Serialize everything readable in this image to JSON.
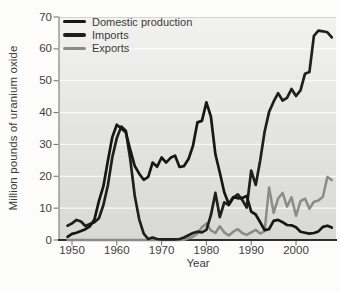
{
  "figure_title": "U.S. uranium oxide production, imports and exports",
  "colors": {
    "domestic_production": "#161616",
    "imports": "#1f1f1f",
    "exports": "#8b8b8b",
    "plot_background_top": "#f2f2f0",
    "plot_background_bottom": "#d8d8d6",
    "gridline": "#ffffff",
    "axis": "#2e2e2e",
    "tick_text": "#414141"
  },
  "chart_data": {
    "type": "line",
    "title": "",
    "xlabel": "Year",
    "ylabel": "Million pounds of uranium oxide",
    "xlim": [
      1947,
      2009
    ],
    "ylim": [
      0,
      70
    ],
    "x_ticks": [
      1950,
      1960,
      1970,
      1980,
      1990,
      2000
    ],
    "y_ticks": [
      0,
      10,
      20,
      30,
      40,
      50,
      60,
      70
    ],
    "grid": "horizontal white gridlines every 10 units",
    "legend_position": "top-left inside plot",
    "x": [
      1949,
      1950,
      1951,
      1952,
      1953,
      1954,
      1955,
      1956,
      1957,
      1958,
      1959,
      1960,
      1961,
      1962,
      1963,
      1964,
      1965,
      1966,
      1967,
      1968,
      1969,
      1970,
      1971,
      1972,
      1973,
      1974,
      1975,
      1976,
      1977,
      1978,
      1979,
      1980,
      1981,
      1982,
      1983,
      1984,
      1985,
      1986,
      1987,
      1988,
      1989,
      1990,
      1991,
      1992,
      1993,
      1994,
      1995,
      1996,
      1997,
      1998,
      1999,
      2000,
      2001,
      2002,
      2003,
      2004,
      2005,
      2006,
      2007,
      2008
    ],
    "series": [
      {
        "name": "Domestic production",
        "color": "#161616",
        "values": [
          1.0,
          1.9,
          2.3,
          2.8,
          3.4,
          4.3,
          6.4,
          12.2,
          16.9,
          24.7,
          32.3,
          36.2,
          35.0,
          33.8,
          28.4,
          23.3,
          20.8,
          18.9,
          19.8,
          24.3,
          23.0,
          25.9,
          24.3,
          25.8,
          26.5,
          22.9,
          23.2,
          25.4,
          29.6,
          36.9,
          37.4,
          43.2,
          38.7,
          26.9,
          21.2,
          14.9,
          11.3,
          13.5,
          13.1,
          13.2,
          13.8,
          8.9,
          8.0,
          5.6,
          3.1,
          3.4,
          6.0,
          6.3,
          5.6,
          4.7,
          4.6,
          4.0,
          2.6,
          2.3,
          2.0,
          2.2,
          2.7,
          4.1,
          4.5,
          3.9
        ]
      },
      {
        "name": "Imports",
        "color": "#1f1f1f",
        "values": [
          4.5,
          5.2,
          6.3,
          5.8,
          4.4,
          5.0,
          5.6,
          6.8,
          11.0,
          17.0,
          26.0,
          32.0,
          35.6,
          34.3,
          25.5,
          14.0,
          6.5,
          2.0,
          0.3,
          0.8,
          0.3,
          0.2,
          0.2,
          0.2,
          0.2,
          0.3,
          0.8,
          1.5,
          2.2,
          2.6,
          2.4,
          3.2,
          7.8,
          14.8,
          7.2,
          11.8,
          11.0,
          13.2,
          14.3,
          12.6,
          10.2,
          21.8,
          17.3,
          25.0,
          34.0,
          40.2,
          43.4,
          46.1,
          43.8,
          44.6,
          47.4,
          45.2,
          47.0,
          52.2,
          52.7,
          64.1,
          65.7,
          65.5,
          65.2,
          63.6
        ]
      },
      {
        "name": "Exports",
        "color": "#8b8b8b",
        "values": [
          0,
          0,
          0,
          0,
          0,
          0,
          0,
          0,
          0,
          0,
          0,
          0,
          0,
          0,
          0,
          0,
          0,
          0,
          0,
          0,
          0,
          0,
          0,
          0,
          0,
          0,
          0.1,
          0.5,
          1.0,
          2.0,
          4.0,
          5.2,
          3.0,
          2.2,
          4.3,
          2.4,
          1.4,
          2.6,
          3.4,
          2.2,
          1.6,
          2.4,
          3.2,
          2.0,
          2.8,
          16.5,
          8.5,
          13.0,
          14.8,
          10.5,
          13.4,
          7.6,
          12.2,
          13.0,
          9.8,
          12.0,
          12.4,
          13.6,
          19.8,
          18.8
        ]
      }
    ]
  }
}
